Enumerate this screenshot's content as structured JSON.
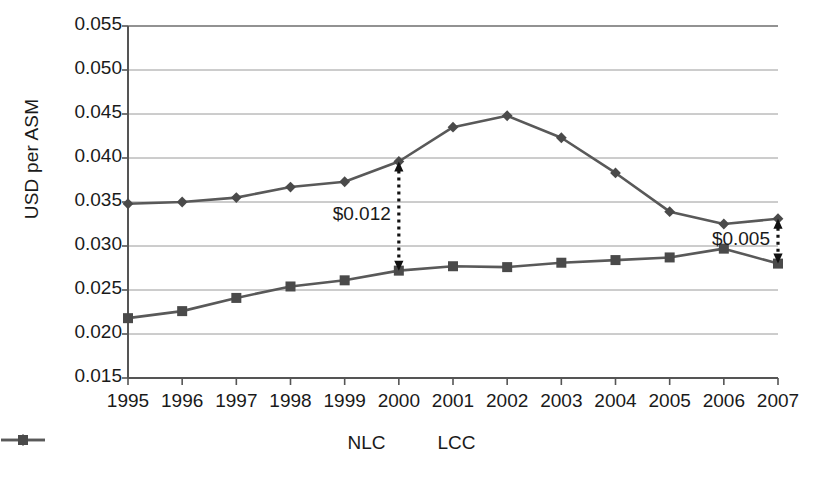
{
  "chart_data": {
    "type": "line",
    "title": "",
    "subtitle": "",
    "xlabel": "",
    "ylabel": "USD per ASM",
    "categories": [
      "1995",
      "1996",
      "1997",
      "1998",
      "1999",
      "2000",
      "2001",
      "2002",
      "2003",
      "2004",
      "2005",
      "2006",
      "2007"
    ],
    "ylim": [
      0.015,
      0.055
    ],
    "ytick_step": 0.005,
    "ytick_labels": [
      "0.055",
      "0.050",
      "0.045",
      "0.040",
      "0.035",
      "0.030",
      "0.025",
      "0.020",
      "0.015"
    ],
    "ytick_values": [
      0.055,
      0.05,
      0.045,
      0.04,
      0.035,
      0.03,
      0.025,
      0.02,
      0.015
    ],
    "grid": true,
    "legend_position": "bottom",
    "series": [
      {
        "name": "NLC",
        "marker": "diamond",
        "color": "#595959",
        "values": [
          0.0348,
          0.035,
          0.0355,
          0.0367,
          0.0373,
          0.0396,
          0.0435,
          0.0448,
          0.0423,
          0.0383,
          0.0339,
          0.0325,
          0.0331
        ]
      },
      {
        "name": "LCC",
        "marker": "square",
        "color": "#595959",
        "values": [
          0.0218,
          0.0226,
          0.0241,
          0.0254,
          0.0261,
          0.0272,
          0.0277,
          0.0276,
          0.0281,
          0.0284,
          0.0287,
          0.0297,
          0.028
        ]
      }
    ],
    "annotations": [
      {
        "label": "$0.012",
        "at_category": "2000",
        "from": 0.0272,
        "to": 0.0396,
        "style": "dotted-double-arrow"
      },
      {
        "label": "$0.005",
        "at_category": "2007",
        "from": 0.028,
        "to": 0.0331,
        "style": "dotted-double-arrow"
      }
    ]
  },
  "legend": {
    "items": [
      {
        "label": "NLC"
      },
      {
        "label": "LCC"
      }
    ]
  }
}
